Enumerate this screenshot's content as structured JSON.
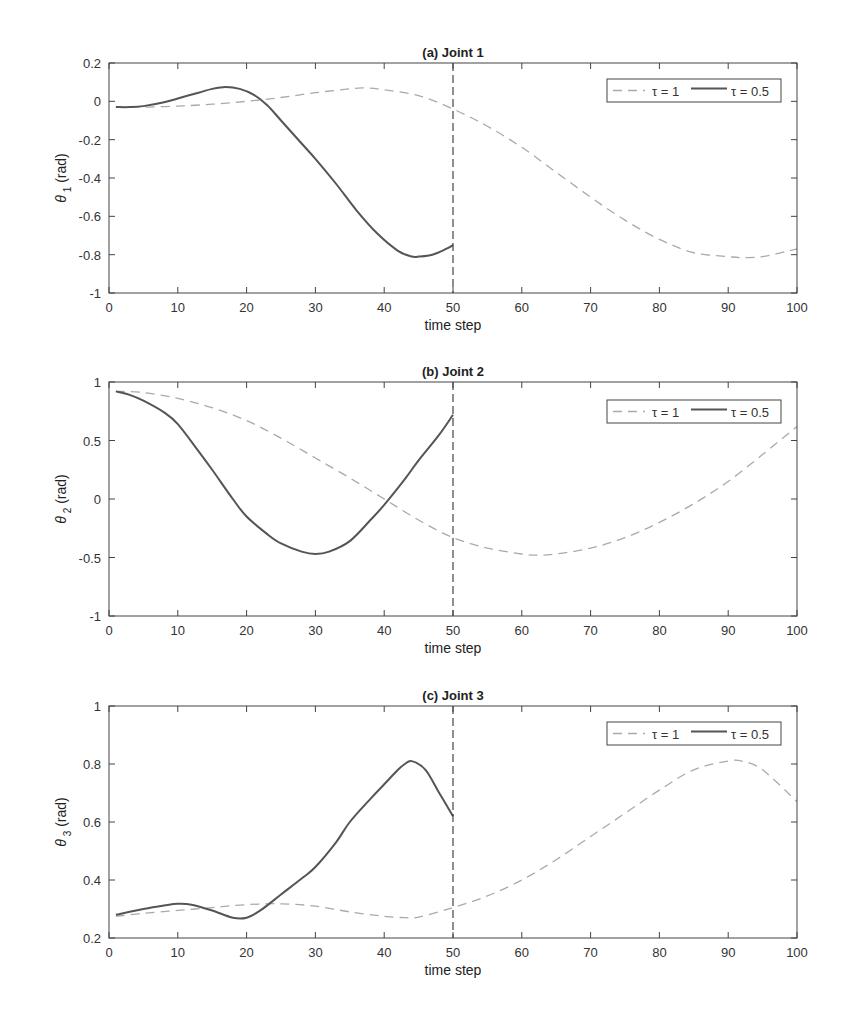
{
  "chart_data": [
    {
      "type": "line",
      "title": "(a) Joint 1",
      "xlabel": "time step",
      "ylabel": "θ1 (rad)",
      "ylabel_symbol": "θ",
      "ylabel_sub": "1",
      "ylabel_unit": "(rad)",
      "xlim": [
        0,
        100
      ],
      "ylim": [
        -1,
        0.2
      ],
      "xticks": [
        0,
        10,
        20,
        30,
        40,
        50,
        60,
        70,
        80,
        90,
        100
      ],
      "yticks": [
        -1,
        -0.8,
        -0.6,
        -0.4,
        -0.2,
        0,
        0.2
      ],
      "ytick_labels": [
        "-1",
        "-0.8",
        "-0.6",
        "-0.4",
        "-0.2",
        "0",
        "0.2"
      ],
      "vline_x": 50,
      "grid": false,
      "legend_position": "upper right",
      "series": [
        {
          "name": "τ = 1",
          "style": "dashed",
          "color": "#aaaaaa",
          "x": [
            1,
            5,
            10,
            15,
            20,
            25,
            30,
            35,
            37,
            40,
            45,
            50,
            55,
            60,
            65,
            70,
            75,
            80,
            85,
            90,
            92,
            95,
            100
          ],
          "y": [
            -0.03,
            -0.03,
            -0.025,
            -0.015,
            0.0,
            0.02,
            0.045,
            0.065,
            0.07,
            0.06,
            0.03,
            -0.04,
            -0.13,
            -0.24,
            -0.37,
            -0.5,
            -0.62,
            -0.72,
            -0.79,
            -0.81,
            -0.815,
            -0.81,
            -0.77
          ]
        },
        {
          "name": "τ = 0.5",
          "style": "solid",
          "color": "#555555",
          "x": [
            1,
            3,
            5,
            8,
            10,
            13,
            15,
            17,
            19,
            21,
            23,
            25,
            28,
            30,
            33,
            36,
            39,
            42,
            44,
            45,
            47,
            49,
            50
          ],
          "y": [
            -0.03,
            -0.03,
            -0.025,
            -0.005,
            0.015,
            0.045,
            0.065,
            0.075,
            0.065,
            0.035,
            -0.02,
            -0.1,
            -0.22,
            -0.3,
            -0.43,
            -0.57,
            -0.69,
            -0.78,
            -0.81,
            -0.81,
            -0.8,
            -0.77,
            -0.75
          ]
        }
      ]
    },
    {
      "type": "line",
      "title": "(b) Joint 2",
      "xlabel": "time step",
      "ylabel": "θ2 (rad)",
      "ylabel_symbol": "θ",
      "ylabel_sub": "2",
      "ylabel_unit": "(rad)",
      "xlim": [
        0,
        100
      ],
      "ylim": [
        -1,
        1
      ],
      "xticks": [
        0,
        10,
        20,
        30,
        40,
        50,
        60,
        70,
        80,
        90,
        100
      ],
      "yticks": [
        -1,
        -0.5,
        0,
        0.5,
        1
      ],
      "ytick_labels": [
        "-1",
        "-0.5",
        "0",
        "0.5",
        "1"
      ],
      "vline_x": 50,
      "grid": false,
      "legend_position": "upper right",
      "series": [
        {
          "name": "τ = 1",
          "style": "dashed",
          "color": "#aaaaaa",
          "x": [
            1,
            5,
            10,
            15,
            20,
            25,
            30,
            35,
            40,
            45,
            50,
            55,
            60,
            62,
            65,
            70,
            75,
            80,
            85,
            90,
            95,
            100
          ],
          "y": [
            0.92,
            0.91,
            0.86,
            0.78,
            0.67,
            0.52,
            0.35,
            0.18,
            0.0,
            -0.18,
            -0.33,
            -0.42,
            -0.47,
            -0.48,
            -0.47,
            -0.42,
            -0.33,
            -0.2,
            -0.04,
            0.15,
            0.38,
            0.62
          ]
        },
        {
          "name": "τ = 0.5",
          "style": "solid",
          "color": "#555555",
          "x": [
            1,
            3,
            5,
            8,
            10,
            13,
            15,
            18,
            20,
            23,
            25,
            28,
            30,
            32,
            35,
            38,
            40,
            43,
            45,
            48,
            50
          ],
          "y": [
            0.92,
            0.89,
            0.84,
            0.74,
            0.64,
            0.41,
            0.25,
            0.0,
            -0.15,
            -0.3,
            -0.38,
            -0.45,
            -0.47,
            -0.45,
            -0.36,
            -0.18,
            -0.05,
            0.17,
            0.33,
            0.55,
            0.72
          ]
        }
      ]
    },
    {
      "type": "line",
      "title": "(c) Joint 3",
      "xlabel": "time step",
      "ylabel": "θ3 (rad)",
      "ylabel_symbol": "θ",
      "ylabel_sub": "3",
      "ylabel_unit": "(rad)",
      "xlim": [
        0,
        100
      ],
      "ylim": [
        0.2,
        1
      ],
      "xticks": [
        0,
        10,
        20,
        30,
        40,
        50,
        60,
        70,
        80,
        90,
        100
      ],
      "yticks": [
        0.2,
        0.4,
        0.6,
        0.8,
        1
      ],
      "ytick_labels": [
        "0.2",
        "0.4",
        "0.6",
        "0.8",
        "1"
      ],
      "vline_x": 50,
      "grid": false,
      "legend_position": "upper right",
      "series": [
        {
          "name": "τ = 1",
          "style": "dashed",
          "color": "#aaaaaa",
          "x": [
            1,
            5,
            10,
            15,
            20,
            25,
            30,
            35,
            40,
            43,
            45,
            50,
            55,
            60,
            65,
            70,
            75,
            80,
            85,
            90,
            92,
            95,
            100
          ],
          "y": [
            0.275,
            0.285,
            0.295,
            0.305,
            0.315,
            0.318,
            0.31,
            0.29,
            0.275,
            0.27,
            0.272,
            0.305,
            0.345,
            0.4,
            0.47,
            0.55,
            0.63,
            0.71,
            0.78,
            0.81,
            0.81,
            0.78,
            0.67
          ]
        },
        {
          "name": "τ = 0.5",
          "style": "solid",
          "color": "#555555",
          "x": [
            1,
            5,
            8,
            10,
            12,
            15,
            18,
            20,
            22,
            25,
            28,
            30,
            33,
            35,
            38,
            40,
            42,
            43,
            44,
            46,
            48,
            50
          ],
          "y": [
            0.28,
            0.3,
            0.312,
            0.318,
            0.315,
            0.295,
            0.27,
            0.27,
            0.295,
            0.35,
            0.405,
            0.445,
            0.53,
            0.6,
            0.68,
            0.73,
            0.78,
            0.8,
            0.81,
            0.78,
            0.7,
            0.62
          ]
        }
      ]
    }
  ],
  "legend": {
    "dashed_label": "τ = 1",
    "solid_label": "τ = 0.5"
  }
}
